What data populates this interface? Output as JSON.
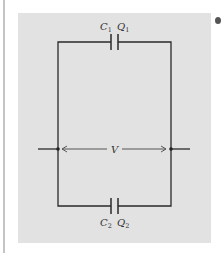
{
  "diagram": {
    "type": "circuit",
    "capacitors": [
      {
        "name": "C",
        "sub": "1",
        "charge": "Q",
        "charge_sub": "1",
        "position": "top"
      },
      {
        "name": "C",
        "sub": "2",
        "charge": "Q",
        "charge_sub": "2",
        "position": "bottom"
      }
    ],
    "voltage_label": "V",
    "colors": {
      "panel": "#e2e2e2",
      "wire": "#2a2a2a",
      "arrow": "#555555"
    }
  }
}
